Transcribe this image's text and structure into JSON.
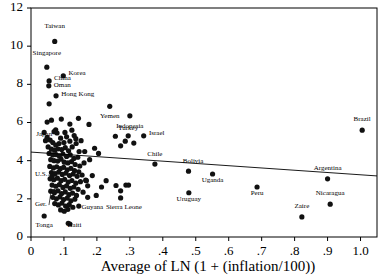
{
  "chart_data": {
    "type": "scatter",
    "title": "",
    "xlabel": "Average of LN (1 + (inflation/100))",
    "ylabel": "",
    "xlim": [
      0,
      1.05
    ],
    "ylim": [
      0,
      12
    ],
    "xticks": [
      0,
      0.1,
      0.2,
      0.3,
      0.4,
      0.5,
      0.6,
      0.7,
      0.8,
      0.9,
      1.0
    ],
    "xtick_labels": [
      "0",
      ".1",
      ".2",
      ".3",
      ".4",
      ".5",
      ".6",
      ".7",
      ".8",
      ".9",
      "1.0"
    ],
    "yticks": [
      0,
      2,
      4,
      6,
      8,
      10,
      12
    ],
    "ytick_labels": [
      "0",
      "2",
      "4",
      "6",
      "8",
      "10",
      "12"
    ],
    "grid": false,
    "legend": "none",
    "marker_color": "#111111",
    "fit_line": {
      "label": "regression line",
      "x0": 0.0,
      "y0": 4.45,
      "x1": 1.05,
      "y1": 3.2
    },
    "labeled_points": [
      {
        "name": "Taiwan",
        "x": 0.072,
        "y": 10.25,
        "lx": 0.072,
        "ly": 10.95,
        "anchor": "middle"
      },
      {
        "name": "Singapore",
        "x": 0.048,
        "y": 8.9,
        "lx": 0.048,
        "ly": 9.55,
        "anchor": "middle"
      },
      {
        "name": "Korea",
        "x": 0.098,
        "y": 8.45,
        "lx": 0.114,
        "ly": 8.48,
        "anchor": "start"
      },
      {
        "name": "China",
        "x": 0.055,
        "y": 8.18,
        "lx": 0.07,
        "ly": 8.22,
        "anchor": "start"
      },
      {
        "name": "Oman",
        "x": 0.054,
        "y": 7.92,
        "lx": 0.069,
        "ly": 7.88,
        "anchor": "start"
      },
      {
        "name": "Hong Kong",
        "x": 0.076,
        "y": 7.4,
        "lx": 0.092,
        "ly": 7.38,
        "anchor": "start"
      },
      {
        "name": "Yemen",
        "x": 0.239,
        "y": 6.85,
        "lx": 0.239,
        "ly": 6.25,
        "anchor": "middle"
      },
      {
        "name": "Indonesia",
        "x": 0.3,
        "y": 6.35,
        "lx": 0.3,
        "ly": 5.72,
        "anchor": "middle"
      },
      {
        "name": "Turkey",
        "x": 0.295,
        "y": 5.3,
        "lx": 0.295,
        "ly": 5.62,
        "anchor": "middle"
      },
      {
        "name": "Israel",
        "x": 0.342,
        "y": 5.3,
        "lx": 0.358,
        "ly": 5.34,
        "anchor": "start"
      },
      {
        "name": "Japan",
        "x": 0.049,
        "y": 5.22,
        "lx": 0.04,
        "ly": 5.3,
        "anchor": "middle"
      },
      {
        "name": "Chile",
        "x": 0.376,
        "y": 3.82,
        "lx": 0.376,
        "ly": 4.22,
        "anchor": "middle"
      },
      {
        "name": "Bolivia",
        "x": 0.478,
        "y": 3.45,
        "lx": 0.492,
        "ly": 3.86,
        "anchor": "middle"
      },
      {
        "name": "Uganda",
        "x": 0.551,
        "y": 3.3,
        "lx": 0.551,
        "ly": 2.88,
        "anchor": "middle"
      },
      {
        "name": "Argentina",
        "x": 0.9,
        "y": 3.05,
        "lx": 0.9,
        "ly": 3.52,
        "anchor": "middle"
      },
      {
        "name": "Brazil",
        "x": 1.005,
        "y": 5.6,
        "lx": 1.005,
        "ly": 6.1,
        "anchor": "middle"
      },
      {
        "name": "Peru",
        "x": 0.686,
        "y": 2.62,
        "lx": 0.686,
        "ly": 2.18,
        "anchor": "middle"
      },
      {
        "name": "Uruguay",
        "x": 0.479,
        "y": 2.32,
        "lx": 0.479,
        "ly": 1.9,
        "anchor": "middle"
      },
      {
        "name": "Nicaragua",
        "x": 0.908,
        "y": 1.72,
        "lx": 0.908,
        "ly": 2.18,
        "anchor": "middle"
      },
      {
        "name": "Zaire",
        "x": 0.822,
        "y": 1.05,
        "lx": 0.822,
        "ly": 1.52,
        "anchor": "middle"
      },
      {
        "name": "Guyana",
        "x": 0.172,
        "y": 2.08,
        "lx": 0.186,
        "ly": 1.46,
        "anchor": "middle"
      },
      {
        "name": "Sierra Leone",
        "x": 0.272,
        "y": 2.05,
        "lx": 0.282,
        "ly": 1.46,
        "anchor": "middle"
      },
      {
        "name": "Haiti",
        "x": 0.113,
        "y": 0.72,
        "lx": 0.132,
        "ly": 0.52,
        "anchor": "middle"
      },
      {
        "name": "Tonga",
        "x": 0.04,
        "y": 1.1,
        "lx": 0.04,
        "ly": 0.52,
        "anchor": "middle"
      },
      {
        "name": "U.S.",
        "x": 0.064,
        "y": 3.18,
        "lx": 0.012,
        "ly": 3.22,
        "anchor": "start",
        "leader": true
      },
      {
        "name": "Ger.",
        "x": 0.07,
        "y": 2.38,
        "lx": 0.012,
        "ly": 1.62,
        "anchor": "start",
        "leader": true
      }
    ],
    "unlabeled_points": [
      {
        "x": 0.055,
        "y": 6.98
      },
      {
        "x": 0.049,
        "y": 6.02
      },
      {
        "x": 0.092,
        "y": 6.18
      },
      {
        "x": 0.118,
        "y": 5.92
      },
      {
        "x": 0.075,
        "y": 5.62
      },
      {
        "x": 0.07,
        "y": 5.52
      },
      {
        "x": 0.079,
        "y": 5.45
      },
      {
        "x": 0.103,
        "y": 5.48
      },
      {
        "x": 0.09,
        "y": 5.18
      },
      {
        "x": 0.062,
        "y": 6.12
      },
      {
        "x": 0.108,
        "y": 5.25
      },
      {
        "x": 0.124,
        "y": 5.6
      },
      {
        "x": 0.131,
        "y": 5.32
      },
      {
        "x": 0.118,
        "y": 5.02
      },
      {
        "x": 0.1,
        "y": 4.95
      },
      {
        "x": 0.085,
        "y": 4.9
      },
      {
        "x": 0.075,
        "y": 4.82
      },
      {
        "x": 0.066,
        "y": 4.95
      },
      {
        "x": 0.058,
        "y": 5.08
      },
      {
        "x": 0.052,
        "y": 4.72
      },
      {
        "x": 0.062,
        "y": 4.6
      },
      {
        "x": 0.072,
        "y": 4.55
      },
      {
        "x": 0.082,
        "y": 4.62
      },
      {
        "x": 0.093,
        "y": 4.58
      },
      {
        "x": 0.104,
        "y": 4.68
      },
      {
        "x": 0.114,
        "y": 4.52
      },
      {
        "x": 0.125,
        "y": 4.72
      },
      {
        "x": 0.137,
        "y": 4.9
      },
      {
        "x": 0.146,
        "y": 4.48
      },
      {
        "x": 0.055,
        "y": 4.38
      },
      {
        "x": 0.066,
        "y": 4.3
      },
      {
        "x": 0.076,
        "y": 4.32
      },
      {
        "x": 0.086,
        "y": 4.25
      },
      {
        "x": 0.097,
        "y": 4.35
      },
      {
        "x": 0.108,
        "y": 4.22
      },
      {
        "x": 0.119,
        "y": 4.3
      },
      {
        "x": 0.13,
        "y": 4.12
      },
      {
        "x": 0.142,
        "y": 4.18
      },
      {
        "x": 0.06,
        "y": 4.05
      },
      {
        "x": 0.07,
        "y": 4.0
      },
      {
        "x": 0.081,
        "y": 3.98
      },
      {
        "x": 0.091,
        "y": 4.08
      },
      {
        "x": 0.101,
        "y": 3.92
      },
      {
        "x": 0.112,
        "y": 3.88
      },
      {
        "x": 0.123,
        "y": 3.95
      },
      {
        "x": 0.134,
        "y": 3.8
      },
      {
        "x": 0.148,
        "y": 3.72
      },
      {
        "x": 0.161,
        "y": 3.88
      },
      {
        "x": 0.057,
        "y": 3.7
      },
      {
        "x": 0.068,
        "y": 3.62
      },
      {
        "x": 0.078,
        "y": 3.68
      },
      {
        "x": 0.089,
        "y": 3.58
      },
      {
        "x": 0.099,
        "y": 3.65
      },
      {
        "x": 0.11,
        "y": 3.52
      },
      {
        "x": 0.121,
        "y": 3.6
      },
      {
        "x": 0.132,
        "y": 3.48
      },
      {
        "x": 0.145,
        "y": 3.42
      },
      {
        "x": 0.062,
        "y": 3.38
      },
      {
        "x": 0.073,
        "y": 3.32
      },
      {
        "x": 0.084,
        "y": 3.4
      },
      {
        "x": 0.095,
        "y": 3.28
      },
      {
        "x": 0.106,
        "y": 3.35
      },
      {
        "x": 0.117,
        "y": 3.22
      },
      {
        "x": 0.128,
        "y": 3.3
      },
      {
        "x": 0.14,
        "y": 3.18
      },
      {
        "x": 0.155,
        "y": 3.25
      },
      {
        "x": 0.058,
        "y": 3.05
      },
      {
        "x": 0.069,
        "y": 3.0
      },
      {
        "x": 0.08,
        "y": 3.08
      },
      {
        "x": 0.091,
        "y": 2.95
      },
      {
        "x": 0.102,
        "y": 3.02
      },
      {
        "x": 0.113,
        "y": 2.88
      },
      {
        "x": 0.124,
        "y": 2.96
      },
      {
        "x": 0.136,
        "y": 2.82
      },
      {
        "x": 0.15,
        "y": 2.9
      },
      {
        "x": 0.166,
        "y": 2.98
      },
      {
        "x": 0.064,
        "y": 2.72
      },
      {
        "x": 0.075,
        "y": 2.66
      },
      {
        "x": 0.086,
        "y": 2.74
      },
      {
        "x": 0.097,
        "y": 2.6
      },
      {
        "x": 0.108,
        "y": 2.68
      },
      {
        "x": 0.119,
        "y": 2.55
      },
      {
        "x": 0.13,
        "y": 2.62
      },
      {
        "x": 0.143,
        "y": 2.5
      },
      {
        "x": 0.06,
        "y": 2.4
      },
      {
        "x": 0.071,
        "y": 2.32
      },
      {
        "x": 0.082,
        "y": 2.42
      },
      {
        "x": 0.093,
        "y": 2.28
      },
      {
        "x": 0.104,
        "y": 2.36
      },
      {
        "x": 0.115,
        "y": 2.22
      },
      {
        "x": 0.126,
        "y": 2.3
      },
      {
        "x": 0.138,
        "y": 2.18
      },
      {
        "x": 0.066,
        "y": 2.08
      },
      {
        "x": 0.077,
        "y": 2.0
      },
      {
        "x": 0.088,
        "y": 2.1
      },
      {
        "x": 0.099,
        "y": 1.96
      },
      {
        "x": 0.11,
        "y": 2.04
      },
      {
        "x": 0.121,
        "y": 1.9
      },
      {
        "x": 0.133,
        "y": 1.98
      },
      {
        "x": 0.072,
        "y": 1.75
      },
      {
        "x": 0.083,
        "y": 1.68
      },
      {
        "x": 0.094,
        "y": 1.78
      },
      {
        "x": 0.105,
        "y": 1.62
      },
      {
        "x": 0.116,
        "y": 1.7
      },
      {
        "x": 0.127,
        "y": 1.56
      },
      {
        "x": 0.09,
        "y": 1.42
      },
      {
        "x": 0.101,
        "y": 1.35
      },
      {
        "x": 0.112,
        "y": 1.45
      },
      {
        "x": 0.145,
        "y": 1.62
      },
      {
        "x": 0.158,
        "y": 2.35
      },
      {
        "x": 0.172,
        "y": 2.68
      },
      {
        "x": 0.186,
        "y": 3.22
      },
      {
        "x": 0.178,
        "y": 4.05
      },
      {
        "x": 0.193,
        "y": 4.65
      },
      {
        "x": 0.205,
        "y": 4.38
      },
      {
        "x": 0.214,
        "y": 2.62
      },
      {
        "x": 0.228,
        "y": 2.95
      },
      {
        "x": 0.198,
        "y": 2.18
      },
      {
        "x": 0.163,
        "y": 4.48
      },
      {
        "x": 0.152,
        "y": 5.05
      },
      {
        "x": 0.144,
        "y": 6.22
      },
      {
        "x": 0.176,
        "y": 5.9
      },
      {
        "x": 0.168,
        "y": 2.95
      },
      {
        "x": 0.256,
        "y": 5.28
      },
      {
        "x": 0.272,
        "y": 4.78
      },
      {
        "x": 0.286,
        "y": 5.02
      },
      {
        "x": 0.312,
        "y": 4.92
      },
      {
        "x": 0.258,
        "y": 2.7
      },
      {
        "x": 0.288,
        "y": 2.72
      },
      {
        "x": 0.296,
        "y": 2.72
      },
      {
        "x": 0.272,
        "y": 2.42
      },
      {
        "x": 0.118,
        "y": 0.68
      },
      {
        "x": 0.04,
        "y": 5.48
      },
      {
        "x": 0.044,
        "y": 5.05
      },
      {
        "x": 0.136,
        "y": 5.15
      }
    ]
  }
}
